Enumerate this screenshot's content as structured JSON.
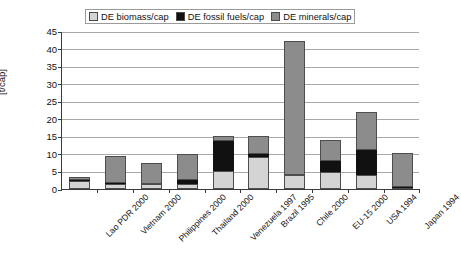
{
  "chart_data": {
    "type": "bar",
    "stacked": true,
    "title": "",
    "xlabel": "",
    "ylabel": "[t/cap]",
    "ylim": [
      0,
      45
    ],
    "ytick_step": 5,
    "yticks": [
      "0",
      "5",
      "10",
      "15",
      "20",
      "25",
      "30",
      "35",
      "40",
      "45"
    ],
    "grid": true,
    "legend_position": "top",
    "categories": [
      "Lao PDR 2000",
      "Vietnam 2000",
      "Philippines 2000",
      "Thailand 2000",
      "Venezuela 1997",
      "Brazil 1995",
      "Chile 2000",
      "EU-15 2000",
      "USA 1994",
      "Japan 1994"
    ],
    "series": [
      {
        "name": "DE biomass/cap",
        "color": "#d4d4d4",
        "values": [
          2.4,
          1.4,
          1.3,
          1.4,
          5.0,
          9.1,
          4.0,
          4.9,
          3.9,
          0.4
        ]
      },
      {
        "name": "DE fossil fuels/cap",
        "color": "#111111",
        "values": [
          0.3,
          0.4,
          0.2,
          1.1,
          8.6,
          0.9,
          0.0,
          3.1,
          7.1,
          0.2
        ]
      },
      {
        "name": "DE minerals/cap",
        "color": "#8c8c8c",
        "values": [
          0.8,
          7.7,
          6.0,
          7.5,
          1.4,
          5.0,
          38.2,
          6.0,
          11.0,
          9.7
        ]
      }
    ],
    "totals": [
      3.5,
      9.5,
      7.5,
      10.0,
      15.0,
      15.0,
      42.2,
      14.0,
      22.0,
      10.3
    ]
  },
  "legend": {
    "items": [
      {
        "label": "DE biomass/cap",
        "swatch_color": "#d4d4d4"
      },
      {
        "label": "DE fossil fuels/cap",
        "swatch_color": "#111111"
      },
      {
        "label": "DE minerals/cap",
        "swatch_color": "#8c8c8c"
      }
    ]
  }
}
